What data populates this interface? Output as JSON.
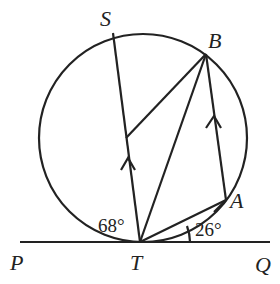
{
  "diagram": {
    "type": "circle-geometry",
    "points": {
      "S": "S",
      "B": "B",
      "A": "A",
      "T": "T",
      "P": "P",
      "Q": "Q"
    },
    "angles": {
      "angle_STP": "68°",
      "angle_ATQ": "26°"
    }
  }
}
